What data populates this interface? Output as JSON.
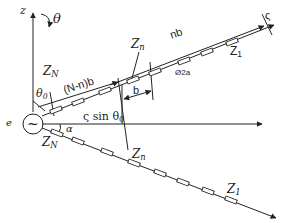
{
  "diagram": {
    "type": "antenna-array-geometry",
    "labels": {
      "z_axis": "z",
      "theta": "θ",
      "theta0": "θ",
      "theta0_sub": "0",
      "zN_top": "Z",
      "zN_top_sub": "N",
      "N_minus_n_b": "(N-n)b",
      "zn_top": "Z",
      "zn_top_sub": "n",
      "b": "b",
      "nb": "nb",
      "zeta": "ς",
      "z1_top": "Z",
      "z1_top_sub": "1",
      "diameter": "Ø2a",
      "zeta_sin_theta0": "ς sin θ",
      "zeta_sin_theta0_sub": "0",
      "source_e": "e",
      "source_symbol": "~",
      "alpha": "α",
      "zN_bottom": "Z",
      "zN_bottom_sub": "N",
      "zn_bottom": "Z",
      "zn_bottom_sub": "n",
      "z1_bottom": "Z",
      "z1_bottom_sub": "1"
    },
    "colors": {
      "stroke": "#222222",
      "background": "#ffffff"
    }
  }
}
